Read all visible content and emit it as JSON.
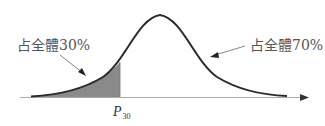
{
  "diagram": {
    "type": "normal-distribution-curve",
    "left_annotation": "占全體30%",
    "right_annotation": "占全體70%",
    "marker_label": "P",
    "marker_subscript": "30",
    "colors": {
      "curve": "#2a2a2a",
      "shade": "#8a8a8a",
      "axis": "#999999",
      "arrow": "#333333",
      "text": "#555555"
    }
  }
}
